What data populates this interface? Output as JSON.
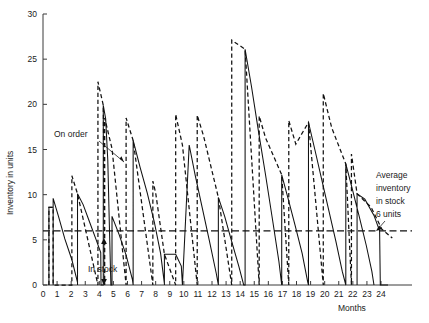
{
  "figure": {
    "title": "",
    "background_color": "#ffffff",
    "line_color": "#111111",
    "axis_color": "#3a3a3a"
  },
  "axes": {
    "y_label": "Inventory in units",
    "x_label": "Months",
    "y_ticks": [
      0,
      5,
      10,
      15,
      20,
      25,
      30
    ],
    "y_tick_labels": [
      "0",
      "5",
      "10",
      "15",
      "20",
      "25",
      "30"
    ],
    "x_ticks": [
      0,
      1,
      2,
      3,
      4,
      5,
      6,
      7,
      8,
      9,
      10,
      11,
      12,
      13,
      14,
      15,
      16,
      17,
      18,
      19,
      20,
      21,
      22,
      23,
      24
    ],
    "x_tick_labels": [
      "0",
      "1",
      "2",
      "3",
      "4",
      "5",
      "6",
      "7",
      "8",
      "9",
      "10",
      "11",
      "12",
      "13",
      "14",
      "15",
      "16",
      "17",
      "18",
      "19",
      "20",
      "21",
      "22",
      "23",
      "24"
    ],
    "ylim": [
      0,
      30
    ],
    "xlim": [
      0,
      26.2
    ],
    "grid": false
  },
  "annotations": {
    "on_order": "On order",
    "in_stock": "In stock",
    "average": "Average\ninventory\nin stock\n6 units",
    "average_line_1": "Average",
    "average_line_2": "inventory",
    "average_line_3": "in stock",
    "average_line_4": "6 units"
  },
  "chart_data": {
    "type": "line",
    "title": "",
    "xlabel": "Months",
    "ylabel": "Inventory in units",
    "xlim": [
      0,
      26.2
    ],
    "ylim": [
      0,
      30
    ],
    "grid": false,
    "legend": "none",
    "average_inventory_in_stock": 6,
    "series": [
      {
        "name": "In stock",
        "style": "solid",
        "points": [
          [
            0.42,
            0.0
          ],
          [
            0.42,
            8.6
          ],
          [
            0.72,
            8.6
          ],
          [
            0.72,
            0.0
          ],
          [
            0.72,
            9.6
          ],
          [
            1.1,
            7.6
          ],
          [
            1.55,
            5.1
          ],
          [
            2.05,
            2.8
          ],
          [
            2.45,
            0.3
          ],
          [
            2.45,
            0.0
          ],
          [
            2.45,
            10.1
          ],
          [
            2.85,
            8.9
          ],
          [
            3.3,
            7.0
          ],
          [
            3.75,
            5.1
          ],
          [
            4.1,
            3.6
          ],
          [
            4.12,
            0.0
          ],
          [
            4.28,
            0.0
          ],
          [
            4.28,
            19.9
          ],
          [
            4.45,
            18.4
          ],
          [
            4.6,
            13.8
          ],
          [
            4.72,
            6.1
          ],
          [
            4.82,
            0.0
          ],
          [
            4.9,
            0.0
          ],
          [
            4.9,
            7.6
          ],
          [
            5.4,
            5.6
          ],
          [
            5.9,
            3.3
          ],
          [
            6.35,
            0.6
          ],
          [
            6.4,
            0.0
          ],
          [
            6.4,
            16.0
          ],
          [
            6.9,
            13.0
          ],
          [
            7.4,
            10.2
          ],
          [
            7.9,
            7.0
          ],
          [
            8.35,
            3.5
          ],
          [
            8.62,
            0.15
          ],
          [
            8.62,
            0.0
          ],
          [
            8.62,
            3.4
          ],
          [
            9.42,
            3.4
          ],
          [
            9.82,
            2.1
          ],
          [
            9.9,
            0.0
          ],
          [
            9.9,
            0.0
          ],
          [
            10.38,
            15.5
          ],
          [
            10.8,
            12.2
          ],
          [
            11.3,
            8.6
          ],
          [
            11.8,
            5.0
          ],
          [
            12.3,
            1.3
          ],
          [
            12.45,
            0.0
          ],
          [
            12.45,
            9.7
          ],
          [
            12.9,
            7.6
          ],
          [
            13.4,
            4.8
          ],
          [
            13.9,
            2.1
          ],
          [
            14.25,
            0.0
          ],
          [
            14.35,
            0.0
          ],
          [
            14.35,
            26.1
          ],
          [
            14.8,
            22.0
          ],
          [
            15.3,
            17.0
          ],
          [
            15.8,
            12.2
          ],
          [
            16.3,
            7.2
          ],
          [
            16.75,
            2.6
          ],
          [
            16.95,
            0.0
          ],
          [
            16.95,
            12.2
          ],
          [
            17.4,
            9.6
          ],
          [
            17.9,
            6.6
          ],
          [
            18.4,
            3.5
          ],
          [
            18.8,
            0.3
          ],
          [
            18.85,
            0.0
          ],
          [
            18.85,
            18.0
          ],
          [
            19.3,
            15.0
          ],
          [
            19.8,
            11.6
          ],
          [
            20.3,
            8.2
          ],
          [
            20.8,
            4.8
          ],
          [
            21.25,
            1.5
          ],
          [
            21.5,
            0.0
          ],
          [
            21.5,
            13.4
          ],
          [
            21.95,
            10.7
          ],
          [
            22.45,
            7.6
          ],
          [
            22.95,
            4.4
          ],
          [
            23.35,
            1.5
          ],
          [
            23.5,
            0.0
          ],
          [
            22.3,
            0.0
          ],
          [
            22.3,
            10.1
          ],
          [
            22.85,
            9.5
          ],
          [
            23.5,
            7.7
          ],
          [
            23.9,
            6.0
          ],
          [
            23.95,
            0.0
          ],
          [
            23.95,
            0.0
          ],
          [
            24.5,
            0.0
          ]
        ]
      },
      {
        "name": "On order",
        "style": "dashed",
        "points": [
          [
            0.42,
            0.0
          ],
          [
            0.42,
            8.6
          ],
          [
            0.72,
            8.6
          ],
          [
            0.72,
            0.0
          ],
          [
            2.05,
            0.0
          ],
          [
            2.05,
            12.1
          ],
          [
            2.45,
            10.1
          ],
          [
            3.9,
            0.0
          ],
          [
            3.9,
            22.5
          ],
          [
            4.28,
            19.9
          ],
          [
            4.38,
            0.0
          ],
          [
            4.38,
            18.5
          ],
          [
            4.9,
            15.1
          ],
          [
            5.9,
            0.0
          ],
          [
            5.9,
            18.5
          ],
          [
            6.4,
            16.0
          ],
          [
            7.8,
            0.0
          ],
          [
            7.8,
            11.5
          ],
          [
            8.0,
            10.2
          ],
          [
            8.62,
            3.4
          ],
          [
            9.42,
            0.0
          ],
          [
            9.42,
            18.9
          ],
          [
            9.9,
            15.5
          ],
          [
            10.95,
            0.0
          ],
          [
            10.95,
            18.8
          ],
          [
            11.4,
            16.5
          ],
          [
            12.45,
            9.7
          ],
          [
            13.4,
            0.0
          ],
          [
            13.4,
            27.1
          ],
          [
            14.35,
            26.1
          ],
          [
            15.35,
            0.0
          ],
          [
            15.35,
            18.7
          ],
          [
            15.8,
            16.3
          ],
          [
            16.95,
            12.2
          ],
          [
            17.45,
            0.0
          ],
          [
            17.45,
            18.2
          ],
          [
            17.95,
            15.6
          ],
          [
            18.85,
            18.0
          ],
          [
            19.9,
            0.0
          ],
          [
            19.9,
            21.2
          ],
          [
            20.5,
            17.4
          ],
          [
            21.5,
            13.4
          ],
          [
            21.9,
            0.0
          ],
          [
            21.9,
            14.5
          ],
          [
            22.3,
            10.1
          ],
          [
            22.3,
            10.1
          ],
          [
            23.3,
            8.6
          ],
          [
            24.05,
            6.2
          ],
          [
            24.8,
            5.2
          ]
        ]
      }
    ]
  }
}
